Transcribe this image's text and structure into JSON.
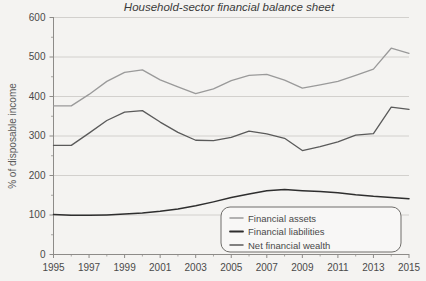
{
  "chart_data": {
    "type": "line",
    "title": "Household-sector financial balance sheet",
    "xlabel": "",
    "ylabel": "% of disposable income",
    "xlim": [
      1995,
      2015
    ],
    "ylim": [
      0,
      600
    ],
    "yticks": [
      0,
      100,
      200,
      300,
      400,
      500,
      600
    ],
    "xticks": [
      1995,
      1997,
      1999,
      2001,
      2003,
      2005,
      2007,
      2009,
      2011,
      2013,
      2015
    ],
    "x": [
      1995,
      1996,
      1997,
      1998,
      1999,
      2000,
      2001,
      2002,
      2003,
      2004,
      2005,
      2006,
      2007,
      2008,
      2009,
      2010,
      2011,
      2012,
      2013,
      2014,
      2015
    ],
    "grid": "horizontal",
    "legend_position": "bottom-center",
    "series": [
      {
        "name": "Financial assets",
        "color": "#9a9a9a",
        "values": [
          375,
          375,
          404,
          437,
          460,
          466,
          441,
          423,
          406,
          418,
          439,
          452,
          455,
          440,
          420,
          428,
          437,
          452,
          468,
          521,
          508
        ]
      },
      {
        "name": "Financial liabilities",
        "color": "#2e2e2e",
        "values": [
          100,
          98,
          98,
          99,
          101,
          104,
          108,
          114,
          122,
          132,
          143,
          152,
          160,
          163,
          160,
          158,
          155,
          150,
          146,
          143,
          140
        ]
      },
      {
        "name": "Net financial wealth",
        "color": "#5a5a5a",
        "values": [
          275,
          275,
          306,
          338,
          359,
          363,
          334,
          308,
          288,
          287,
          295,
          311,
          304,
          293,
          262,
          272,
          284,
          301,
          305,
          372,
          366
        ]
      }
    ]
  },
  "legend": {
    "items": [
      {
        "label": "Financial assets"
      },
      {
        "label": "Financial liabilities"
      },
      {
        "label": "Net financial wealth"
      }
    ]
  }
}
